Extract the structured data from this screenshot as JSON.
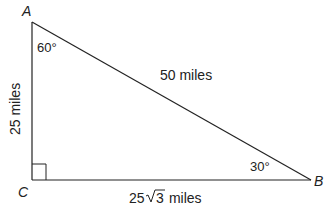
{
  "diagram": {
    "type": "right-triangle",
    "vertices": {
      "A": {
        "label": "A",
        "x": 32,
        "y": 22
      },
      "B": {
        "label": "B",
        "x": 311,
        "y": 180
      },
      "C": {
        "label": "C",
        "x": 32,
        "y": 180
      }
    },
    "angles": {
      "A": "60°",
      "B": "30°",
      "C": "right-angle"
    },
    "sides": {
      "AC": "25 miles",
      "AB": "50 miles",
      "CB_prefix": "25",
      "CB_radicand": "3",
      "CB_suffix": " miles"
    },
    "colors": {
      "line": "#222222",
      "background": "#ffffff"
    }
  }
}
